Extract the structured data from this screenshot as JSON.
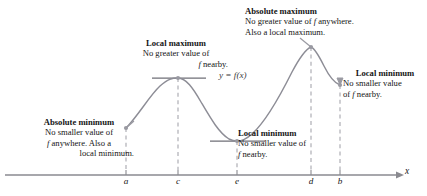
{
  "figure": {
    "curve_label": "y = f(x)",
    "axis_x_label": "x"
  },
  "annotations": {
    "local_max": {
      "heading": "Local maximum",
      "line1": "No greater value of",
      "line2": "f nearby."
    },
    "absolute_max": {
      "heading": "Absolute maximum",
      "line1": "No greater value of f anywhere.",
      "line2": "Also a local maximum."
    },
    "local_min_right": {
      "heading": "Local minimum",
      "line1": "No smaller value",
      "line2": "of f nearby."
    },
    "absolute_min": {
      "heading": "Absolute minimum",
      "line1": "No smaller value of",
      "line2": "f anywhere. Also a",
      "line3": "local minimum."
    },
    "local_min_mid": {
      "heading": "Local minimum",
      "line1": "No smaller value of",
      "line2": "f nearby."
    }
  },
  "axis_ticks": [
    {
      "label": "a",
      "x": 126
    },
    {
      "label": "c",
      "x": 178
    },
    {
      "label": "e",
      "x": 237
    },
    {
      "label": "d",
      "x": 311
    },
    {
      "label": "b",
      "x": 340
    }
  ],
  "colors": {
    "curve": "#8d8d96",
    "axis": "#8a8a90",
    "dashed": "#b0b0b6",
    "tangent": "#6f6f77",
    "point": "#9a9aa2",
    "text": "#141414"
  },
  "chart_data": {
    "type": "line",
    "xlabel": "x",
    "ylabel": "y",
    "grid": false,
    "legend": "none",
    "series": [
      {
        "name": "y = f(x)",
        "points": [
          {
            "x": "a",
            "px": 126,
            "py": 128,
            "role": "absolute minimum / endpoint"
          },
          {
            "x": "c",
            "px": 178,
            "py": 78,
            "role": "local maximum"
          },
          {
            "x": "e",
            "px": 237,
            "py": 141,
            "role": "local minimum"
          },
          {
            "x": "d",
            "px": 311,
            "py": 47,
            "role": "absolute maximum / local maximum"
          },
          {
            "x": "b",
            "px": 340,
            "py": 85,
            "role": "local minimum / endpoint"
          }
        ]
      }
    ],
    "marked_points": [
      {
        "label": "a",
        "type": "absolute minimum",
        "note": "Also a local minimum."
      },
      {
        "label": "c",
        "type": "local maximum",
        "note": "No greater value of f nearby."
      },
      {
        "label": "e",
        "type": "local minimum",
        "note": "No smaller value of f nearby."
      },
      {
        "label": "d",
        "type": "absolute maximum",
        "note": "Also a local maximum."
      },
      {
        "label": "b",
        "type": "local minimum",
        "note": "No smaller value of f nearby."
      }
    ],
    "tick_labels": [
      "a",
      "c",
      "e",
      "d",
      "b"
    ],
    "axis_range_px": {
      "x": [
        5,
        400
      ],
      "y_baseline": 175
    }
  }
}
